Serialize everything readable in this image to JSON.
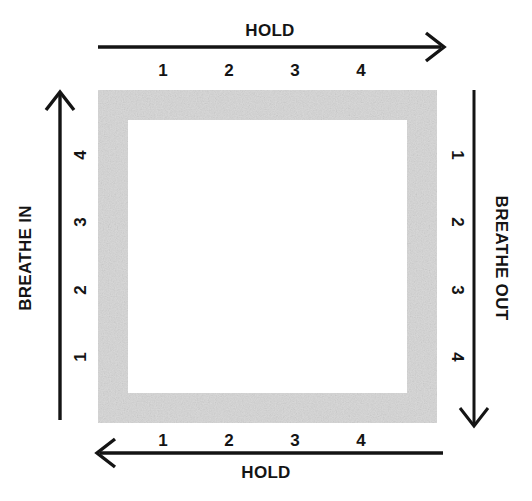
{
  "diagram": {
    "colors": {
      "stroke": "#141414",
      "box_fill": "#d9d9d9",
      "box_inner": "#ffffff",
      "background": "#ffffff"
    },
    "box": {
      "outer": {
        "x": 98,
        "y": 90,
        "width": 339,
        "height": 333
      },
      "border_thickness": 30
    },
    "sides": {
      "top": {
        "label": "HOLD",
        "direction": "right",
        "counts": [
          "1",
          "2",
          "3",
          "4"
        ],
        "count_positions_x": [
          163,
          229,
          295,
          361
        ],
        "count_y": 70,
        "axis_y": 47,
        "axis_from_x": 98,
        "axis_to_x": 443
      },
      "left": {
        "label": "BREATHE IN",
        "direction": "up",
        "counts": [
          "1",
          "2",
          "3",
          "4"
        ],
        "count_positions_y": [
          357,
          290,
          222,
          155
        ],
        "count_x": 80,
        "axis_x": 60,
        "axis_from_y": 420,
        "axis_to_y": 92
      },
      "right": {
        "label": "BREATHE OUT",
        "direction": "down",
        "counts": [
          "1",
          "2",
          "3",
          "4"
        ],
        "count_positions_y": [
          155,
          222,
          290,
          357
        ],
        "count_x": 457,
        "axis_x": 474,
        "axis_from_y": 90,
        "axis_to_y": 426
      },
      "bottom": {
        "label": "HOLD",
        "direction": "left",
        "counts": [
          "1",
          "2",
          "3",
          "4"
        ],
        "count_positions_x": [
          163,
          229,
          295,
          361
        ],
        "count_y": 440,
        "axis_y": 453,
        "axis_from_x": 443,
        "axis_to_x": 98
      }
    }
  }
}
